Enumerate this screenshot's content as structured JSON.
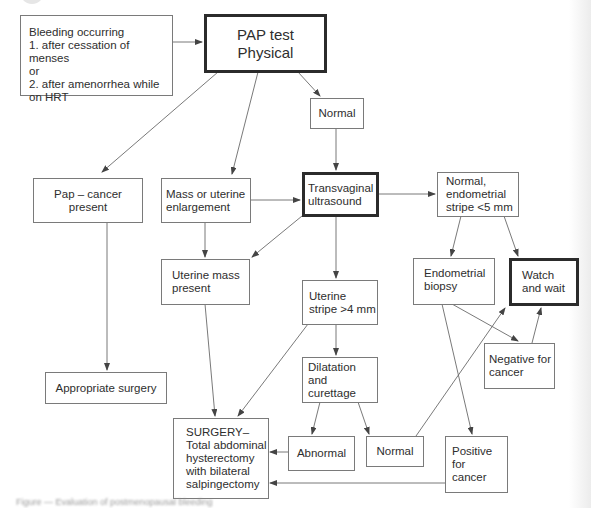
{
  "diagram": {
    "type": "flowchart",
    "colors": {
      "box_border": "#7a7a7a",
      "thick_border": "#2b2b2b",
      "line": "#666666",
      "text": "#2e2e2e"
    },
    "nodes": {
      "bleeding": "Bleeding occurring\n1. after cessation of menses\nor\n2. after amenorrhea while\non HRT",
      "pap_test": "PAP test\nPhysical",
      "normal_top": "Normal",
      "pap_cancer": "Pap – cancer present",
      "mass_enlargement": "Mass or uterine\nenlargement",
      "transvaginal": "Transvaginal\nultrasound",
      "normal_stripe": "Normal,\nendometrial\nstripe <5 mm",
      "uterine_mass": "Uterine mass\npresent",
      "endometrial_biopsy": "Endometrial\nbiopsy",
      "watch_wait": "Watch\nand wait",
      "uterine_stripe": "Uterine\nstripe >4 mm",
      "dilatation": "Dilatation\nand curettage",
      "negative": "Negative for\ncancer",
      "appropriate_surgery": "Appropriate surgery",
      "surgery": "SURGERY–\nTotal abdominal\nhysterectomy\nwith bilateral\nsalpingectomy",
      "abnormal": "Abnormal",
      "normal_bottom": "Normal",
      "positive": "Positive for\ncancer"
    },
    "edges": [
      [
        "bleeding",
        "pap_test"
      ],
      [
        "pap_test",
        "pap_cancer"
      ],
      [
        "pap_test",
        "mass_enlargement"
      ],
      [
        "pap_test",
        "normal_top"
      ],
      [
        "normal_top",
        "transvaginal"
      ],
      [
        "mass_enlargement",
        "transvaginal"
      ],
      [
        "mass_enlargement",
        "uterine_mass"
      ],
      [
        "transvaginal",
        "uterine_mass"
      ],
      [
        "transvaginal",
        "normal_stripe"
      ],
      [
        "transvaginal",
        "uterine_stripe"
      ],
      [
        "normal_stripe",
        "endometrial_biopsy"
      ],
      [
        "normal_stripe",
        "watch_wait"
      ],
      [
        "endometrial_biopsy",
        "negative"
      ],
      [
        "endometrial_biopsy",
        "positive"
      ],
      [
        "negative",
        "watch_wait"
      ],
      [
        "pap_cancer",
        "appropriate_surgery"
      ],
      [
        "uterine_mass",
        "surgery"
      ],
      [
        "uterine_stripe",
        "surgery"
      ],
      [
        "uterine_stripe",
        "dilatation"
      ],
      [
        "dilatation",
        "abnormal"
      ],
      [
        "dilatation",
        "normal_bottom"
      ],
      [
        "abnormal",
        "surgery"
      ],
      [
        "normal_bottom",
        "watch_wait"
      ],
      [
        "positive",
        "surgery"
      ]
    ],
    "caption": "Figure — Evaluation of postmenopausal bleeding"
  }
}
